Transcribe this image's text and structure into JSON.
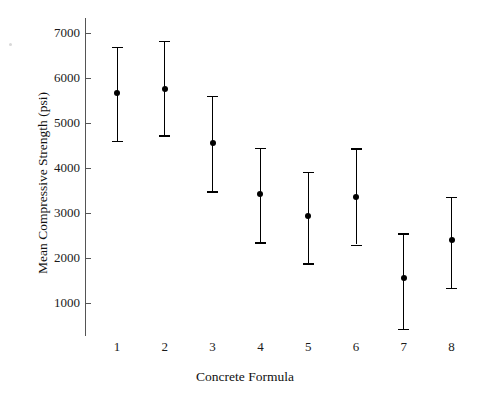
{
  "chart_data": {
    "type": "scatter",
    "title": "",
    "xlabel": "Concrete Formula",
    "ylabel": "Mean Compressive Strength (psi)",
    "categories": [
      "1",
      "2",
      "3",
      "4",
      "5",
      "6",
      "7",
      "8"
    ],
    "values": [
      5660,
      5750,
      4550,
      3420,
      2930,
      3360,
      1560,
      2390
    ],
    "error_low": [
      4610,
      4730,
      3480,
      2350,
      1880,
      2300,
      430,
      1340
    ],
    "error_high": [
      6690,
      6820,
      5600,
      4450,
      3910,
      4440,
      2550,
      3360
    ],
    "series": [
      {
        "name": "Mean Compressive Strength (psi)",
        "values": [
          5660,
          5750,
          4550,
          3420,
          2930,
          3360,
          1560,
          2390
        ]
      }
    ],
    "points": [
      {
        "x": "1",
        "mean": 5660,
        "lower": 4610,
        "upper": 6690
      },
      {
        "x": "2",
        "mean": 5750,
        "lower": 4730,
        "upper": 6820
      },
      {
        "x": "3",
        "mean": 4550,
        "lower": 3480,
        "upper": 5600
      },
      {
        "x": "4",
        "mean": 3420,
        "lower": 2350,
        "upper": 4450
      },
      {
        "x": "5",
        "mean": 2930,
        "lower": 1880,
        "upper": 3910
      },
      {
        "x": "6",
        "mean": 3360,
        "lower": 2300,
        "upper": 4440
      },
      {
        "x": "7",
        "mean": 1560,
        "lower": 430,
        "upper": 2550
      },
      {
        "x": "8",
        "mean": 2390,
        "lower": 1340,
        "upper": 3360
      }
    ],
    "ytick_labels": [
      "7000",
      "6000",
      "5000",
      "4000",
      "3000",
      "2000",
      "1000"
    ],
    "ytick_values": [
      7000,
      6000,
      5000,
      4000,
      3000,
      2000,
      1000
    ],
    "ylim": [
      400,
      7350
    ],
    "xlim": [
      0.4,
      8.6
    ],
    "grid": false,
    "legend": "none",
    "marker_color": "#000000",
    "axis_color": "#555555"
  }
}
